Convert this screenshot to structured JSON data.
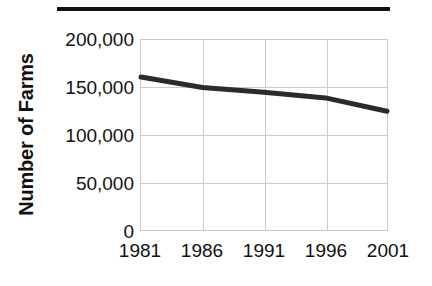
{
  "chart_data": {
    "type": "line",
    "title": "",
    "xlabel": "",
    "ylabel": "Number of Farms",
    "x": [
      1981,
      1986,
      1991,
      1996,
      2001
    ],
    "xtick_labels": [
      "1981",
      "1986",
      "1991",
      "1996",
      "2001"
    ],
    "values": [
      161000,
      150000,
      145000,
      139000,
      125000
    ],
    "series": [
      {
        "name": "Number of Farms",
        "values": [
          161000,
          150000,
          145000,
          139000,
          125000
        ]
      }
    ],
    "ylim": [
      0,
      200000
    ],
    "xlim": [
      1981,
      2001
    ],
    "ytick_values": [
      200000,
      150000,
      100000,
      50000,
      0
    ],
    "ytick_labels": [
      "200,000",
      "150,000",
      "100,000",
      "50,000",
      "0"
    ],
    "grid": true,
    "legend": false,
    "legend_position": "none",
    "line_color": "#2b2b2b",
    "line_width": 5,
    "gridline_color": "#cccccc",
    "plot_border_color": "#c9c9c9",
    "background_color": "#ffffff",
    "text_color": "#111111",
    "annotations": []
  },
  "decorations": {
    "top_rule_color": "#111111"
  }
}
